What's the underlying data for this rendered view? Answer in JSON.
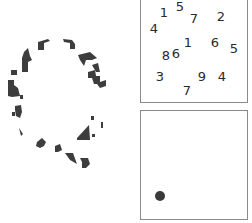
{
  "figure": {
    "fragment_color": "#3d3d3d",
    "panel_border_color": "#8a8a8a",
    "left_stimulus": {
      "description": "fragmented letter Q"
    },
    "number_panel": {
      "numbers": [
        {
          "value": "1",
          "x": 23,
          "y": 12
        },
        {
          "value": "5",
          "x": 39,
          "y": 6
        },
        {
          "value": "7",
          "x": 53,
          "y": 18
        },
        {
          "value": "2",
          "x": 80,
          "y": 16
        },
        {
          "value": "4",
          "x": 13,
          "y": 28
        },
        {
          "value": "1",
          "x": 47,
          "y": 42
        },
        {
          "value": "6",
          "x": 74,
          "y": 42
        },
        {
          "value": "5",
          "x": 93,
          "y": 48
        },
        {
          "value": "8",
          "x": 25,
          "y": 55
        },
        {
          "value": "6",
          "x": 35,
          "y": 53
        },
        {
          "value": "3",
          "x": 19,
          "y": 76
        },
        {
          "value": "9",
          "x": 61,
          "y": 76
        },
        {
          "value": "4",
          "x": 81,
          "y": 76
        },
        {
          "value": "7",
          "x": 46,
          "y": 90
        }
      ]
    },
    "dot_panel": {
      "dot": {
        "x": 19,
        "y": 85,
        "color": "#3a3a3a"
      }
    }
  }
}
